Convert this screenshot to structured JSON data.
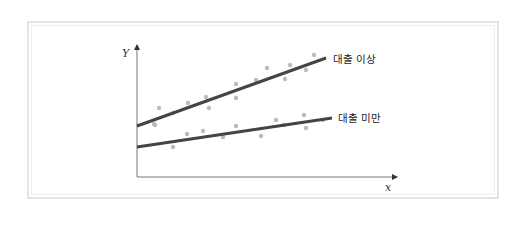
{
  "chart_data": {
    "type": "scatter",
    "title": "",
    "xlabel": "x",
    "ylabel": "Y",
    "grid": false,
    "legend_position": "inline-right",
    "series": [
      {
        "name": "대출 이상",
        "line_color": "#444444",
        "point_color": "#bbbbbb",
        "regression_line": {
          "x0": 137,
          "y0": 126,
          "x1": 326,
          "y1": 58
        },
        "points": [
          [
            154,
            124
          ],
          [
            159,
            108
          ],
          [
            173,
            113
          ],
          [
            188,
            103
          ],
          [
            206,
            97
          ],
          [
            209,
            108
          ],
          [
            236,
            84
          ],
          [
            236,
            98
          ],
          [
            256,
            80
          ],
          [
            267,
            68
          ],
          [
            285,
            79
          ],
          [
            290,
            65
          ],
          [
            306,
            70
          ],
          [
            314,
            55
          ]
        ]
      },
      {
        "name": "대출 미만",
        "line_color": "#444444",
        "point_color": "#bbbbbb",
        "regression_line": {
          "x0": 137,
          "y0": 147,
          "x1": 332,
          "y1": 118
        },
        "points": [
          [
            155,
            125
          ],
          [
            173,
            147
          ],
          [
            187,
            134
          ],
          [
            203,
            131
          ],
          [
            223,
            137
          ],
          [
            236,
            126
          ],
          [
            261,
            136
          ],
          [
            276,
            120
          ],
          [
            284,
            125
          ],
          [
            304,
            115
          ],
          [
            306,
            128
          ],
          [
            323,
            120
          ]
        ]
      }
    ],
    "axes": {
      "origin": [
        137,
        177
      ],
      "y_axis_top": 44,
      "x_axis_right": 398
    }
  },
  "labels": {
    "y_axis": "Y",
    "x_axis": "x",
    "upper_series": "대출 이상",
    "lower_series": "대출 미만"
  }
}
